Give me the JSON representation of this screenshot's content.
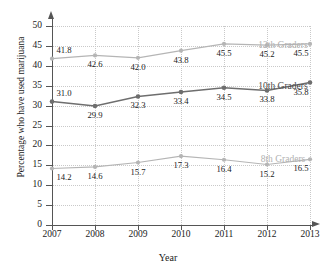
{
  "chart_data": {
    "type": "line",
    "title": "",
    "xlabel": "Year",
    "ylabel": "Percentage who have used marijuana",
    "categories": [
      "2007",
      "2008",
      "2009",
      "2010",
      "2011",
      "2012",
      "2013"
    ],
    "x": [
      2007,
      2008,
      2009,
      2010,
      2011,
      2012,
      2013
    ],
    "ylim": [
      0,
      50
    ],
    "xlim": [
      2007,
      2013
    ],
    "yticks": [
      "0",
      "5",
      "10",
      "15",
      "20",
      "25",
      "30",
      "35",
      "40",
      "45",
      "50"
    ],
    "ytick_values": [
      0,
      5,
      10,
      15,
      20,
      25,
      30,
      35,
      40,
      45,
      50
    ],
    "grid": true,
    "legend_position": "inline-right",
    "series": [
      {
        "name": "12th Graders",
        "color": "#b5b5b5",
        "values": [
          41.8,
          42.6,
          42.0,
          43.8,
          45.5,
          45.2,
          45.5
        ],
        "labels": [
          "41.8",
          "42.6",
          "42.0",
          "43.8",
          "45.5",
          "45.2",
          "45.5"
        ]
      },
      {
        "name": "10th Graders",
        "color": "#6e6e6e",
        "values": [
          31.0,
          29.9,
          32.3,
          33.4,
          34.5,
          33.8,
          35.8
        ],
        "labels": [
          "31.0",
          "29.9",
          "32.3",
          "33.4",
          "34.5",
          "33.8",
          "35.8"
        ]
      },
      {
        "name": "8th Graders",
        "color": "#b5b5b5",
        "values": [
          14.2,
          14.6,
          15.7,
          17.3,
          16.4,
          15.2,
          16.5
        ],
        "labels": [
          "14.2",
          "14.6",
          "15.7",
          "17.3",
          "16.4",
          "15.2",
          "16.5"
        ]
      }
    ]
  },
  "colors": {
    "axis": "#555555",
    "grid": "#c9c9c9",
    "light_series": "#b5b5b5",
    "dark_series": "#6e6e6e",
    "background": "#ffffff"
  }
}
